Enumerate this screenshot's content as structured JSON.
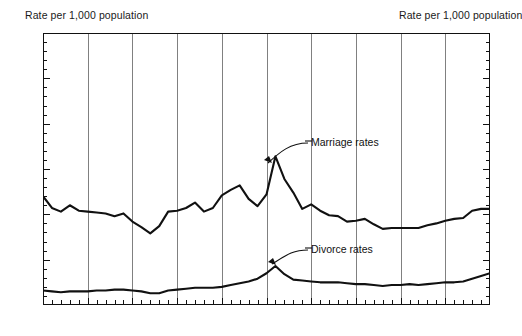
{
  "header": {
    "left_label": "Rate per 1,000 population",
    "right_label": "Rate per 1,000 population"
  },
  "annotations": {
    "marriage_label": "Marriage rates",
    "divorce_label": "Divorce rates"
  },
  "axis": {
    "y_ticks": [
      "0",
      "5",
      "10",
      "15",
      "20",
      "25",
      "30"
    ],
    "x_ticks": [
      "1920",
      "1925",
      "1930",
      "1935",
      "1940",
      "1945",
      "1950",
      "1955",
      "1960",
      "1965",
      "1970"
    ]
  },
  "chart_data": {
    "type": "line",
    "title": "",
    "subtitle": "",
    "xlabel": "",
    "ylabel": "Rate per 1,000 population",
    "xlim": [
      1920,
      1970
    ],
    "ylim": [
      0,
      30
    ],
    "y_major_step": 5,
    "y_minor_step": 1,
    "x_major_step": 5,
    "x_minor_step": 1,
    "grid": "vertical-major-only",
    "legend": "inline-annotations",
    "line_color": "#111111",
    "grid_color": "#808080",
    "axis_color": "#111111",
    "x": [
      1920,
      1921,
      1922,
      1923,
      1924,
      1925,
      1926,
      1927,
      1928,
      1929,
      1930,
      1931,
      1932,
      1933,
      1934,
      1935,
      1936,
      1937,
      1938,
      1939,
      1940,
      1941,
      1942,
      1943,
      1944,
      1945,
      1946,
      1947,
      1948,
      1949,
      1950,
      1951,
      1952,
      1953,
      1954,
      1955,
      1956,
      1957,
      1958,
      1959,
      1960,
      1961,
      1962,
      1963,
      1964,
      1965,
      1966,
      1967,
      1968,
      1969,
      1970
    ],
    "series": [
      {
        "name": "Marriage rates",
        "values": [
          12.0,
          10.7,
          10.3,
          11.0,
          10.4,
          10.3,
          10.2,
          10.1,
          9.8,
          10.1,
          9.2,
          8.6,
          7.9,
          8.7,
          10.3,
          10.4,
          10.7,
          11.3,
          10.3,
          10.7,
          12.1,
          12.7,
          13.2,
          11.7,
          10.9,
          12.2,
          16.4,
          13.9,
          12.4,
          10.6,
          11.1,
          10.4,
          9.9,
          9.8,
          9.2,
          9.3,
          9.5,
          8.9,
          8.4,
          8.5,
          8.5,
          8.5,
          8.5,
          8.8,
          9.0,
          9.3,
          9.5,
          9.6,
          10.4,
          10.6,
          10.6
        ]
      },
      {
        "name": "Divorce rates",
        "values": [
          1.6,
          1.5,
          1.4,
          1.5,
          1.5,
          1.5,
          1.6,
          1.6,
          1.7,
          1.7,
          1.6,
          1.5,
          1.3,
          1.3,
          1.6,
          1.7,
          1.8,
          1.9,
          1.9,
          1.9,
          2.0,
          2.2,
          2.4,
          2.6,
          2.9,
          3.5,
          4.3,
          3.4,
          2.8,
          2.7,
          2.6,
          2.5,
          2.5,
          2.5,
          2.4,
          2.3,
          2.3,
          2.2,
          2.1,
          2.2,
          2.2,
          2.3,
          2.2,
          2.3,
          2.4,
          2.5,
          2.5,
          2.6,
          2.9,
          3.2,
          3.5
        ]
      }
    ]
  }
}
